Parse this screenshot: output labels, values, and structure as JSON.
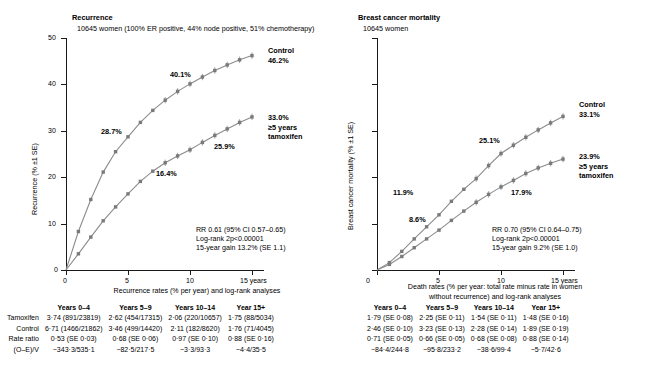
{
  "chart_data": [
    {
      "type": "line",
      "panel": "recurrence",
      "title": "Recurrence",
      "subtitle": "10645 women (100% ER positive, 44% node positive, 51% chemotherapy)",
      "ylabel": "Recurrence (% ±1 SE)",
      "xlabel": "",
      "ylim": [
        0,
        50
      ],
      "xlim": [
        0,
        16
      ],
      "yticks": [
        "0",
        "10",
        "20",
        "30",
        "40",
        "50"
      ],
      "xticks": [
        "0",
        "5",
        "10",
        "15 years"
      ],
      "grid": false,
      "legend_position": "right-inline",
      "series": [
        {
          "name": "Control",
          "end_label": "46.2%",
          "mid_labels": [
            {
              "text": "28.7%",
              "x": 5
            },
            {
              "text": "40.1%",
              "x": 10
            }
          ],
          "x": [
            0,
            1,
            2,
            3,
            4,
            5,
            6,
            7,
            8,
            9,
            10,
            11,
            12,
            13,
            14,
            15
          ],
          "values": [
            0,
            8.3,
            15.2,
            21.1,
            25.5,
            28.7,
            31.8,
            34.4,
            36.6,
            38.5,
            40.1,
            41.6,
            43.0,
            44.2,
            45.3,
            46.2
          ]
        },
        {
          "name": "≥5 years tamoxifen",
          "end_label": "33.0%",
          "mid_labels": [
            {
              "text": "16.4%",
              "x": 5
            },
            {
              "text": "25.9%",
              "x": 10
            }
          ],
          "x": [
            0,
            1,
            2,
            3,
            4,
            5,
            6,
            7,
            8,
            9,
            10,
            11,
            12,
            13,
            14,
            15
          ],
          "values": [
            0,
            3.5,
            7.1,
            10.6,
            13.6,
            16.4,
            19.1,
            21.3,
            23.1,
            24.6,
            25.9,
            27.5,
            29.0,
            30.4,
            31.8,
            33.0
          ]
        }
      ],
      "annotations": [
        "RR 0.61 (95% CI 0.57–0.65)",
        "Log-rank 2p<0.00001",
        "15-year gain 13.2% (SE 1.1)"
      ]
    },
    {
      "type": "line",
      "panel": "breast-cancer-mortality",
      "title": "Breast cancer mortality",
      "subtitle": "10645 women",
      "ylabel": "Breast cancer mortality (% ±1 SE)",
      "xlabel": "",
      "ylim": [
        0,
        50
      ],
      "xlim": [
        0,
        16
      ],
      "yticks": [
        "",
        "",
        "",
        "",
        "",
        ""
      ],
      "xticks": [
        "0",
        "5",
        "10",
        "15 years"
      ],
      "grid": false,
      "legend_position": "right-inline",
      "series": [
        {
          "name": "Control",
          "end_label": "33.1%",
          "mid_labels": [
            {
              "text": "11.9%",
              "x": 5
            },
            {
              "text": "25.1%",
              "x": 10
            }
          ],
          "x": [
            0,
            1,
            2,
            3,
            4,
            5,
            6,
            7,
            8,
            9,
            10,
            11,
            12,
            13,
            14,
            15
          ],
          "values": [
            0,
            1.6,
            4.0,
            6.7,
            9.3,
            11.9,
            14.8,
            17.4,
            19.7,
            22.5,
            25.1,
            26.9,
            28.6,
            30.2,
            31.7,
            33.1
          ]
        },
        {
          "name": "≥5 years tamoxifen",
          "end_label": "23.9%",
          "mid_labels": [
            {
              "text": "8.6%",
              "x": 5
            },
            {
              "text": "17.9%",
              "x": 10
            }
          ],
          "x": [
            0,
            1,
            2,
            3,
            4,
            5,
            6,
            7,
            8,
            9,
            10,
            11,
            12,
            13,
            14,
            15
          ],
          "values": [
            0,
            1.2,
            2.9,
            4.8,
            6.7,
            8.6,
            10.7,
            12.7,
            14.6,
            16.3,
            17.9,
            19.3,
            20.8,
            22.0,
            23.0,
            23.9
          ]
        }
      ],
      "annotations": [
        "RR 0.70 (95% CI 0.64–0.75)",
        "Log-rank 2p<0.00001",
        "15-year gain 9.2% (SE 1.0)"
      ]
    }
  ],
  "tables": {
    "left": {
      "caption": "Recurrence rates (% per year) and log-rank analyses",
      "columns": [
        "",
        "Years 0–4",
        "Years 5–9",
        "Years 10–14",
        "Year 15+"
      ],
      "rows": [
        {
          "label": "Tamoxifen",
          "cells": [
            "3·74 (891/23819)",
            "2·62 (454/17315)",
            "2·06 (220/10657)",
            "1·75 (88/5034)"
          ]
        },
        {
          "label": "Control",
          "cells": [
            "6·71 (1466/21862)",
            "3·46 (499/14420)",
            "2·11 (182/8620)",
            "1·76 (71/4045)"
          ]
        },
        {
          "label": "Rate ratio",
          "cells": [
            "0·53 (SE 0·03)",
            "0·68 (SE 0·06)",
            "0·97 (SE 0·10)",
            "0·88 (SE 0·16)"
          ]
        },
        {
          "label": "(O–E)/V",
          "cells": [
            "−343·3/535·1",
            "−82·5/217·5",
            "−3·3/93·3",
            "−4·4/35·5"
          ]
        }
      ]
    },
    "right": {
      "caption_line1": "Death rates (% per year: total rate minus rate in women",
      "caption_line2": "without recurrence) and log-rank analyses",
      "columns": [
        "Years 0–4",
        "Years 5–9",
        "Years 10–14",
        "Year 15+"
      ],
      "rows": [
        {
          "cells": [
            "1·79 (SE 0·08)",
            "2·25 (SE 0·11)",
            "1·54 (SE 0·11)",
            "1·48 (SE 0·16)"
          ]
        },
        {
          "cells": [
            "2·46 (SE 0·10)",
            "3·23 (SE 0·13)",
            "2·28 (SE 0·14)",
            "1·89 (SE 0·19)"
          ]
        },
        {
          "cells": [
            "0·71 (SE 0·05)",
            "0·66 (SE 0·05)",
            "0·68 (SE 0·08)",
            "0·88 (SE 0·14)"
          ]
        },
        {
          "cells": [
            "−84·4/244·8",
            "−95·8/233·2",
            "−38·6/99·4",
            "−5·7/42·6"
          ]
        }
      ]
    }
  },
  "colors": {
    "axis": "#1a1a1a",
    "curve": "#8c8c8c",
    "marker": "#7a7a7a",
    "text": "#000000"
  }
}
